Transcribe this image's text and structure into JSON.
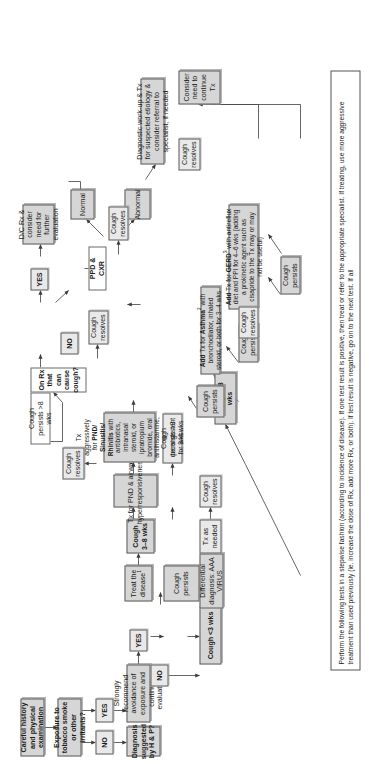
{
  "diagram": {
    "orientation": "rotated-90",
    "accent_color": "#d6d6d6",
    "nodes": {
      "history": "Careful history and physical examination",
      "exposure": "Exposure to tobacco smoke or other irritants?",
      "exposure_no": "NO",
      "exposure_yes": "YES",
      "avoidance": "Strongly recommend avoidance of exposure and continue evaluation",
      "diagnosis_q": "Diagnosis suggested by H & P?",
      "dx_yes": "YES",
      "dx_no": "NO",
      "treat_disease": "Treat the disease",
      "treat_disease_sup": "1",
      "cough_persists_a": "Cough persists",
      "cough_lt3": "Cough <3 wks",
      "cough_3_8": "Cough 3–8 wks",
      "cough_gt8": "Cough >8 wks",
      "ddx": "Differential diagnosis: AAA VIRUS",
      "tx_as_needed": "Tx as needed",
      "cough_resolves_1": "Cough resolves",
      "cough_resolves_2": "Cough resolves",
      "cough_resolves_3": "Cough resolves",
      "cough_resolves_4": "Cough resolves",
      "cough_resolves_5": "Cough resolves",
      "cough_resolves_6": "Cough resolves",
      "tx_pnd": "Tx for PND & airway hyperresponsiveness",
      "cough_persists_gt3": "Cough persists >3 wks",
      "tx_aggressive_l1": "Tx aggressively for ",
      "tx_aggressive_b1": "PND/ Sinusitis/ Rhinitis",
      "tx_aggressive_l2": " with antibiotics, intranasal steroid, or ipratropium bromide, oral antihistamine, & decongestant for 3–4 wks",
      "cough_persists_b": "Cough persists",
      "add_asthma_pre": "Add",
      "add_asthma_mid": " Tx for ",
      "add_asthma_b": "Asthma",
      "add_asthma_sup": "2",
      "add_asthma_post": " with bronchodilator, inhaled steroid, or both for 3–4 wks",
      "cough_persists_c": "Cough persists",
      "add_gerd_pre": "Add",
      "add_gerd_mid": " Tx for ",
      "add_gerd_b": "GERD",
      "add_gerd_sup": "3",
      "add_gerd_post": " with antireflux diet and PPI for 4–6 wks (adding a prokinetic agent such as cisapride to the Tx may or may not be useful)",
      "cough_persists_d": "Cough persists",
      "consider_continue": "Consider need to continue Tx",
      "cough_persists_gt8": "Cough persists >8 wks",
      "on_rx": "On Rx that can cause cough?",
      "on_rx_no": "NO",
      "on_rx_yes": "YES",
      "dc_rx": "D/C Rx & consider need for further evaluation",
      "ppd_cxr": "PPD & CXR",
      "normal": "Normal",
      "abnormal": "Abnormal",
      "diagnostic_workup": "Diagnostic work-up & Tx for suspected etiology & consider referral to specialist, if needed",
      "footnote": "Perform the following tests in a stepwise fashion (according to incidence of disease). If one test result is positive, then treat or refer to the appropriate specialist. If treating, use more aggressive treatment than used previously (ie. increase the dose of Rx, add more Rx, or both). If test result is negative, go on to the next test. If all"
    }
  }
}
